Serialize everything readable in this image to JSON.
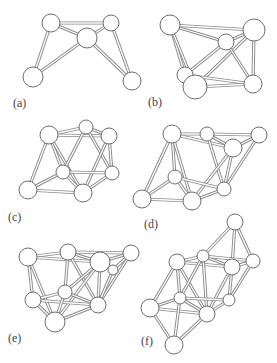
{
  "figure": {
    "panels": [
      {
        "label": "(a)",
        "label_pos": [
          13,
          97
        ],
        "atoms": [
          [
            51,
            23,
            9
          ],
          [
            111,
            23,
            8
          ],
          [
            87,
            38,
            10
          ],
          [
            33,
            77,
            10
          ],
          [
            132,
            81,
            9
          ]
        ],
        "bonds": [
          [
            0,
            1
          ],
          [
            0,
            2
          ],
          [
            1,
            2
          ],
          [
            0,
            3
          ],
          [
            2,
            3
          ],
          [
            2,
            4
          ],
          [
            1,
            4
          ]
        ]
      },
      {
        "label": "(b)",
        "label_pos": [
          148,
          96
        ],
        "atoms": [
          [
            170,
            25,
            10
          ],
          [
            226,
            42,
            8
          ],
          [
            254,
            30,
            11
          ],
          [
            185,
            75,
            8
          ],
          [
            195,
            87,
            12
          ],
          [
            253,
            84,
            9
          ]
        ],
        "bonds": [
          [
            0,
            1
          ],
          [
            1,
            2
          ],
          [
            0,
            2
          ],
          [
            0,
            3
          ],
          [
            0,
            4
          ],
          [
            1,
            3
          ],
          [
            2,
            4
          ],
          [
            2,
            5
          ],
          [
            1,
            5
          ],
          [
            3,
            5
          ],
          [
            4,
            5
          ],
          [
            3,
            4
          ]
        ]
      },
      {
        "label": "(c)",
        "label_pos": [
          8,
          211
        ],
        "atoms": [
          [
            49,
            135,
            9
          ],
          [
            86,
            127,
            7
          ],
          [
            109,
            136,
            8
          ],
          [
            63,
            172,
            7
          ],
          [
            112,
            173,
            7
          ],
          [
            28,
            190,
            9
          ],
          [
            83,
            193,
            9
          ]
        ],
        "bonds": [
          [
            0,
            1
          ],
          [
            1,
            2
          ],
          [
            0,
            2
          ],
          [
            0,
            5
          ],
          [
            0,
            3
          ],
          [
            0,
            6
          ],
          [
            1,
            3
          ],
          [
            1,
            4
          ],
          [
            2,
            4
          ],
          [
            2,
            6
          ],
          [
            3,
            4
          ],
          [
            3,
            5
          ],
          [
            3,
            6
          ],
          [
            4,
            6
          ],
          [
            5,
            6
          ]
        ]
      },
      {
        "label": "(d)",
        "label_pos": [
          144,
          218
        ],
        "atoms": [
          [
            172,
            134,
            9
          ],
          [
            207,
            134,
            7
          ],
          [
            259,
            135,
            8
          ],
          [
            233,
            148,
            9
          ],
          [
            175,
            177,
            7
          ],
          [
            224,
            189,
            7
          ],
          [
            142,
            199,
            9
          ],
          [
            192,
            201,
            9
          ]
        ],
        "bonds": [
          [
            0,
            1
          ],
          [
            1,
            2
          ],
          [
            0,
            3
          ],
          [
            1,
            3
          ],
          [
            2,
            3
          ],
          [
            0,
            4
          ],
          [
            0,
            6
          ],
          [
            0,
            7
          ],
          [
            1,
            5
          ],
          [
            2,
            5
          ],
          [
            3,
            5
          ],
          [
            3,
            7
          ],
          [
            4,
            5
          ],
          [
            4,
            6
          ],
          [
            4,
            7
          ],
          [
            5,
            7
          ],
          [
            6,
            7
          ]
        ]
      },
      {
        "label": "(e)",
        "label_pos": [
          8,
          332
        ],
        "atoms": [
          [
            28,
            257,
            9
          ],
          [
            68,
            252,
            8
          ],
          [
            100,
            262,
            10
          ],
          [
            131,
            253,
            8
          ],
          [
            113,
            270,
            5
          ],
          [
            65,
            292,
            7
          ],
          [
            33,
            300,
            8
          ],
          [
            98,
            305,
            8
          ],
          [
            55,
            322,
            10
          ]
        ],
        "bonds": [
          [
            0,
            1
          ],
          [
            1,
            2
          ],
          [
            0,
            2
          ],
          [
            2,
            3
          ],
          [
            1,
            3
          ],
          [
            0,
            6
          ],
          [
            0,
            8
          ],
          [
            1,
            5
          ],
          [
            1,
            7
          ],
          [
            2,
            5
          ],
          [
            2,
            8
          ],
          [
            3,
            4
          ],
          [
            3,
            7
          ],
          [
            4,
            7
          ],
          [
            2,
            7
          ],
          [
            5,
            6
          ],
          [
            5,
            7
          ],
          [
            6,
            7
          ],
          [
            6,
            8
          ],
          [
            7,
            8
          ],
          [
            5,
            8
          ]
        ]
      },
      {
        "label": "(f)",
        "label_pos": [
          141,
          335
        ],
        "atoms": [
          [
            235,
            222,
            8
          ],
          [
            177,
            262,
            8
          ],
          [
            203,
            256,
            6
          ],
          [
            232,
            267,
            8
          ],
          [
            253,
            261,
            7
          ],
          [
            180,
            298,
            6
          ],
          [
            150,
            308,
            9
          ],
          [
            229,
            300,
            6
          ],
          [
            207,
            314,
            8
          ],
          [
            174,
            345,
            9
          ]
        ],
        "bonds": [
          [
            0,
            2
          ],
          [
            0,
            3
          ],
          [
            0,
            4
          ],
          [
            1,
            2
          ],
          [
            2,
            3
          ],
          [
            3,
            4
          ],
          [
            1,
            3
          ],
          [
            2,
            4
          ],
          [
            1,
            5
          ],
          [
            1,
            6
          ],
          [
            1,
            8
          ],
          [
            2,
            8
          ],
          [
            3,
            7
          ],
          [
            3,
            8
          ],
          [
            4,
            7
          ],
          [
            5,
            7
          ],
          [
            5,
            6
          ],
          [
            5,
            8
          ],
          [
            6,
            8
          ],
          [
            6,
            9
          ],
          [
            8,
            9
          ],
          [
            5,
            9
          ],
          [
            7,
            8
          ],
          [
            2,
            5
          ]
        ]
      }
    ]
  }
}
